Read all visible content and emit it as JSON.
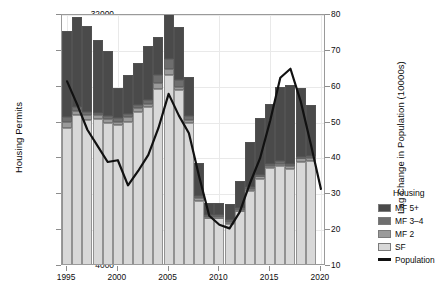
{
  "chart_data": {
    "type": "bar",
    "title": "",
    "xlabel": "",
    "ylabel": "Housing Permits",
    "ylabel_right": "Lag Change in Population (10000s)",
    "xlim": [
      1994.5,
      2020.5
    ],
    "ylim": [
      4000,
      32000
    ],
    "ylim_right": [
      10,
      80
    ],
    "grid": true,
    "legend_position": "right",
    "legend_title": "Housing",
    "x_ticks": [
      "1995",
      "2000",
      "2005",
      "2010",
      "2015",
      "2020"
    ],
    "x_tick_values": [
      1995,
      2000,
      2005,
      2010,
      2015,
      2020
    ],
    "y_ticks": [
      "4000",
      "8000",
      "12000",
      "16000",
      "20000",
      "24000",
      "28000",
      "32000"
    ],
    "y_tick_values": [
      4000,
      8000,
      12000,
      16000,
      20000,
      24000,
      28000,
      32000
    ],
    "y_ticks_right": [
      "10",
      "20",
      "30",
      "40",
      "50",
      "60",
      "70",
      "80"
    ],
    "y_tick_values_right": [
      10,
      20,
      30,
      40,
      50,
      60,
      70,
      80
    ],
    "categories": [
      1995,
      1996,
      1997,
      1998,
      1999,
      2000,
      2001,
      2002,
      2003,
      2004,
      2005,
      2006,
      2007,
      2008,
      2009,
      2010,
      2011,
      2012,
      2013,
      2014,
      2015,
      2016,
      2017,
      2018,
      2019
    ],
    "series": [
      {
        "name": "SF",
        "color": "#d8d8d8",
        "values": [
          15400,
          16800,
          16300,
          16400,
          16000,
          15700,
          16100,
          17200,
          17700,
          19800,
          21300,
          19600,
          15900,
          7300,
          5300,
          5300,
          4700,
          6100,
          8400,
          9700,
          10900,
          11100,
          10800,
          11600,
          11700
        ]
      },
      {
        "name": "MF 2",
        "color": "#9a9a9a",
        "values": [
          700,
          500,
          500,
          400,
          400,
          400,
          500,
          400,
          400,
          600,
          700,
          400,
          400,
          300,
          200,
          200,
          200,
          200,
          200,
          300,
          300,
          300,
          300,
          400,
          400
        ]
      },
      {
        "name": "MF 3-4",
        "color": "#6e6e6e",
        "values": [
          500,
          400,
          400,
          300,
          300,
          400,
          400,
          400,
          400,
          900,
          1100,
          700,
          400,
          200,
          200,
          200,
          200,
          200,
          200,
          200,
          200,
          300,
          300,
          200,
          200
        ]
      },
      {
        "name": "MF 5+",
        "color": "#4a4a4a",
        "values": [
          9600,
          10100,
          9600,
          8100,
          7300,
          3400,
          4300,
          4700,
          6000,
          4200,
          7900,
          6000,
          4400,
          3700,
          1300,
          1300,
          1800,
          3000,
          5000,
          6300,
          6700,
          8300,
          8800,
          7700,
          5700
        ]
      }
    ],
    "line_series": {
      "name": "Population",
      "color": "#111111",
      "x": [
        1995,
        1996,
        1997,
        1998,
        1999,
        2000,
        2001,
        2002,
        2003,
        2004,
        2005,
        2006,
        2007,
        2008,
        2009,
        2010,
        2011,
        2012,
        2013,
        2014,
        2015,
        2016,
        2017,
        2018,
        2019
      ],
      "values": [
        61.5,
        55.0,
        48.0,
        43.5,
        39.0,
        39.5,
        32.5,
        36.5,
        41.0,
        48.5,
        58.0,
        52.0,
        47.0,
        35.0,
        24.0,
        21.5,
        20.5,
        25.0,
        33.0,
        40.0,
        50.5,
        62.5,
        65.0,
        56.0,
        44.0,
        31.5
      ]
    },
    "legend_items": [
      {
        "label": "MF 5+",
        "color": "#4a4a4a",
        "type": "swatch"
      },
      {
        "label": "MF 3–4",
        "color": "#6e6e6e",
        "type": "swatch"
      },
      {
        "label": "MF 2",
        "color": "#9a9a9a",
        "type": "swatch"
      },
      {
        "label": "SF",
        "color": "#d8d8d8",
        "type": "swatch"
      },
      {
        "label": "Population",
        "color": "#111111",
        "type": "line"
      }
    ]
  }
}
